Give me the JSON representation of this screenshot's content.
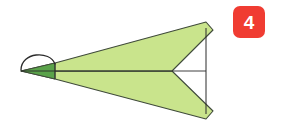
{
  "diagram": {
    "step_badge": {
      "number": "4",
      "background_color": "#f03c32",
      "text_color": "#ffffff"
    },
    "colors": {
      "background": "#ffffff",
      "body_fill": "#c9e48c",
      "nose_fill": "#5aa24a",
      "outline": "#3f4a3a",
      "crease_line": "#2b2b2b"
    },
    "shapes": {
      "upper_wing": {
        "name": "upper-wing",
        "fill": "#c9e48c",
        "points": "21,71 55,63 206,22 213,30 172,71"
      },
      "lower_wing": {
        "name": "lower-wing",
        "fill": "#c9e48c",
        "points": "21,71 55,79 206,119 213,111 172,71"
      },
      "nose_flap": {
        "name": "nose-flap",
        "fill": "#5aa24a",
        "points": "21,71 55,63 55,79"
      }
    },
    "lines": {
      "center_crease": {
        "name": "center-crease",
        "x1": 21,
        "y1": 71,
        "x2": 206,
        "y2": 71
      },
      "nose_fold_crease": {
        "name": "nose-fold-crease",
        "x1": 55,
        "y1": 63,
        "x2": 55,
        "y2": 79
      },
      "tail_vertical": {
        "name": "tail-vertical-edge",
        "x1": 206,
        "y1": 28,
        "x2": 206,
        "y2": 114
      }
    },
    "fold_arrow": {
      "name": "nose-fold-arrow",
      "description": "curved arc over nose tip indicating fold direction",
      "path": "M 21,70 C 22,53 50,52 55,64"
    }
  }
}
